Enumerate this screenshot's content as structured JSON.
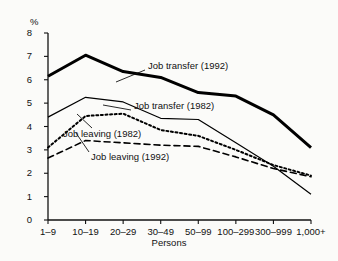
{
  "chart_data": {
    "type": "line",
    "title": "",
    "xlabel": "Persons",
    "ylabel": "%",
    "categories": [
      "1–9",
      "10–19",
      "20–29",
      "30–49",
      "50–99",
      "100–299",
      "300–999",
      "1,000+"
    ],
    "ylim": [
      0,
      8
    ],
    "yticks": [
      0,
      1,
      2,
      3,
      4,
      5,
      6,
      7,
      8
    ],
    "ytick_labels": [
      "0",
      "1",
      "2",
      "3",
      "4",
      "5",
      "6",
      "7",
      "8"
    ],
    "grid": false,
    "legend_position": "inline-annotations",
    "series": [
      {
        "name": "Job transfer (1992)",
        "style": "thick-solid",
        "color": "#000000",
        "values": [
          6.15,
          7.05,
          6.35,
          6.1,
          5.45,
          5.3,
          4.5,
          3.1
        ]
      },
      {
        "name": "Job transfer (1982)",
        "style": "thin-solid",
        "color": "#000000",
        "values": [
          4.4,
          5.25,
          5.05,
          4.35,
          4.3,
          3.3,
          2.3,
          1.1
        ]
      },
      {
        "name": "Job leaving (1982)",
        "style": "dotted",
        "color": "#000000",
        "values": [
          3.1,
          4.45,
          4.55,
          3.85,
          3.6,
          3.0,
          2.35,
          1.9
        ]
      },
      {
        "name": "Job leaving (1992)",
        "style": "dashed",
        "color": "#000000",
        "values": [
          2.65,
          3.4,
          3.3,
          3.2,
          3.15,
          2.7,
          2.2,
          1.85
        ]
      }
    ],
    "annotations": [
      {
        "text": "Job transfer (1992)",
        "x": 148,
        "y": 61,
        "leader_from": [
          145,
          70
        ],
        "leader_to": [
          116,
          82
        ]
      },
      {
        "text": "Job transfer (1982)",
        "x": 134,
        "y": 101,
        "leader_from": [
          131,
          110
        ],
        "leader_to": [
          103,
          105
        ]
      },
      {
        "text": "Job leaving (1982)",
        "x": 63,
        "y": 129,
        "leader_from": [
          92,
          128
        ],
        "leader_to": [
          77,
          114
        ]
      },
      {
        "text": "Job leaving (1992)",
        "x": 91,
        "y": 152,
        "leader_from": [
          89,
          152
        ],
        "leader_to": [
          76,
          133
        ]
      }
    ]
  }
}
